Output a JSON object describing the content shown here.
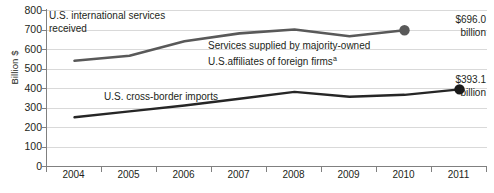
{
  "chart_data": {
    "type": "line",
    "title": "",
    "xlabel": "",
    "ylabel": "Billion $",
    "categories": [
      "2004",
      "2005",
      "2006",
      "2007",
      "2008",
      "2009",
      "2010",
      "2011"
    ],
    "ylim": [
      0,
      800
    ],
    "ytick_values": [
      "800",
      "700",
      "600",
      "500",
      "400",
      "300",
      "200",
      "100",
      "0"
    ],
    "grid": true,
    "legend": "none",
    "series": [
      {
        "name": "Services supplied by majority-owned U.S. affiliates of foreign firms",
        "color": "#595959",
        "x": [
          "2004",
          "2005",
          "2006",
          "2007",
          "2008",
          "2009",
          "2010"
        ],
        "values": [
          540,
          565,
          640,
          680,
          700,
          665,
          696
        ],
        "end_marker": true
      },
      {
        "name": "U.S. cross-border imports",
        "color": "#262626",
        "x": [
          "2004",
          "2005",
          "2006",
          "2007",
          "2008",
          "2009",
          "2010",
          "2011"
        ],
        "values": [
          250,
          280,
          310,
          345,
          380,
          355,
          365,
          393.1
        ],
        "end_marker": true
      }
    ],
    "annotations": [
      {
        "id": "upper-series-title",
        "text": "U.S. international services\nreceived"
      },
      {
        "id": "affiliates-label",
        "text": "Services supplied by majority-owned\nU.S.affiliates of foreign firms",
        "superscript": "a"
      },
      {
        "id": "imports-label",
        "text": "U.S. cross-border imports"
      },
      {
        "id": "upper-value-callout",
        "text": "$696.0\nbillion"
      },
      {
        "id": "lower-value-callout",
        "text": "$393.1\nbillion"
      }
    ]
  }
}
